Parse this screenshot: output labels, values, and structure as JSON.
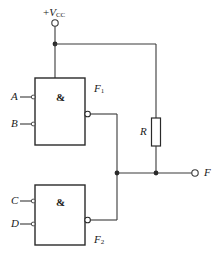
{
  "diagram": {
    "supply": {
      "label_prefix": "+",
      "label_symbol": "V",
      "label_subscript": "CC",
      "terminal": "open-circle"
    },
    "gates": [
      {
        "id": "gate-1",
        "symbol": "&",
        "label": "F",
        "label_subscript": "1",
        "inputs": [
          {
            "name": "A",
            "inverted": true
          },
          {
            "name": "B",
            "inverted": true
          }
        ],
        "output_inverted": true
      },
      {
        "id": "gate-2",
        "symbol": "&",
        "label": "F",
        "label_subscript": "2",
        "inputs": [
          {
            "name": "C",
            "inverted": true
          },
          {
            "name": "D",
            "inverted": true
          }
        ],
        "output_inverted": true
      }
    ],
    "resistor": {
      "label": "R",
      "orientation": "vertical"
    },
    "output": {
      "label": "F",
      "terminal": "open-circle"
    },
    "colors": {
      "wire": "#3a3a3a",
      "gate_border": "#2a2a2a",
      "text": "#1a1a1a",
      "background": "#ffffff"
    }
  }
}
